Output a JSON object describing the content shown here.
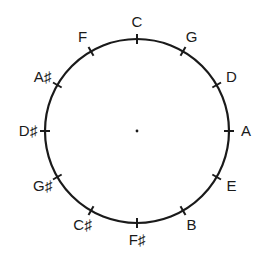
{
  "diagram": {
    "type": "circle-of-fifths",
    "center": [
      137,
      131
    ],
    "radius": 92,
    "stroke_color": "#1a1a1a",
    "notes": [
      {
        "label": "C",
        "angle": 0
      },
      {
        "label": "G",
        "angle": 30
      },
      {
        "label": "D",
        "angle": 60
      },
      {
        "label": "A",
        "angle": 90
      },
      {
        "label": "E",
        "angle": 120
      },
      {
        "label": "B",
        "angle": 150
      },
      {
        "label": "F♯",
        "angle": 180
      },
      {
        "label": "C♯",
        "angle": 210
      },
      {
        "label": "G♯",
        "angle": 240
      },
      {
        "label": "D♯",
        "angle": 270
      },
      {
        "label": "A♯",
        "angle": 300
      },
      {
        "label": "F",
        "angle": 330
      }
    ]
  }
}
